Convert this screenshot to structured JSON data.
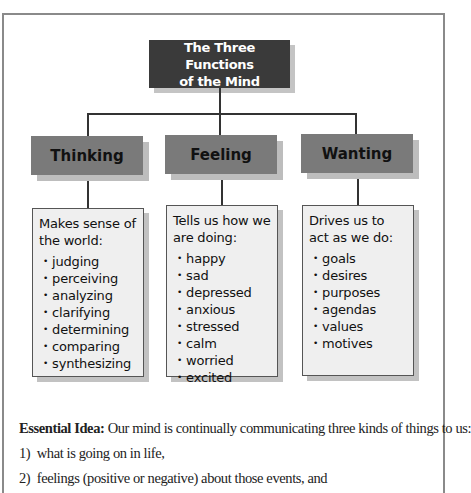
{
  "diagram": {
    "title_line1": "The Three Functions",
    "title_line2": "of the Mind",
    "columns": [
      {
        "heading": "Thinking",
        "description": "Makes sense of the world:",
        "items": [
          "judging",
          "perceiving",
          "analyzing",
          "clarifying",
          "determining",
          "comparing",
          "synthesizing"
        ]
      },
      {
        "heading": "Feeling",
        "description": "Tells us how we are doing:",
        "items": [
          "happy",
          "sad",
          "depressed",
          "anxious",
          "stressed",
          "calm",
          "worried",
          "excited"
        ]
      },
      {
        "heading": "Wanting",
        "description": "Drives us to act as we do:",
        "items": [
          "goals",
          "desires",
          "purposes",
          "agendas",
          "values",
          "motives"
        ]
      }
    ]
  },
  "essential": {
    "label": "Essential Idea:",
    "text": " Our mind is continually communicating three kinds of things to us:",
    "points": [
      "1)  what is going on in life,",
      "2)  feelings (positive or negative) about those events, and"
    ]
  },
  "colors": {
    "title_bg": "#3a3a3a",
    "heading_bg": "#7a7a7a",
    "content_bg": "#efefef"
  }
}
